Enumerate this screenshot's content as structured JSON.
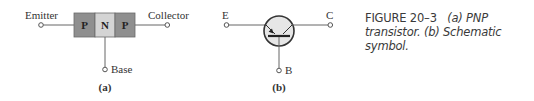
{
  "diagram_a": {
    "emitter_label": "Emitter",
    "collector_label": "Collector",
    "base_label": "Base",
    "regions": [
      "P",
      "N",
      "P"
    ],
    "sublabel": "(a)",
    "colors": {
      "p_region": "#8f8f8f",
      "n_region": "#d4d4d4",
      "lines": "#555555"
    }
  },
  "diagram_b": {
    "e_label": "E",
    "c_label": "C",
    "b_label": "B",
    "sublabel": "(b)"
  },
  "caption": {
    "figure_number": "FIGURE 20–3",
    "text_line1": "(a) PNP",
    "text_line2": "transistor. (b) Schematic",
    "text_line3": "symbol."
  }
}
